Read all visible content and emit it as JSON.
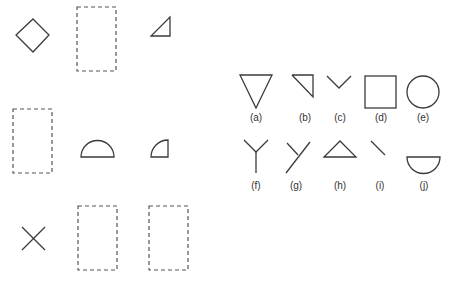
{
  "figure": {
    "left_panel": {
      "description": "Shapes with dashed placeholder rectangles",
      "rows": [
        [
          "diamond",
          "dashed-rectangle",
          "right-triangle"
        ],
        [
          "dashed-rectangle",
          "semicircle",
          "quarter-circle"
        ],
        [
          "x-cross",
          "dashed-rectangle",
          "dashed-rectangle"
        ]
      ]
    },
    "right_panel": {
      "items": [
        {
          "label": "(a)",
          "shape": "inverted-triangle"
        },
        {
          "label": "(b)",
          "shape": "right-angle-wedge"
        },
        {
          "label": "(c)",
          "shape": "v-chevron"
        },
        {
          "label": "(d)",
          "shape": "square"
        },
        {
          "label": "(e)",
          "shape": "circle"
        },
        {
          "label": "(f)",
          "shape": "y-junction"
        },
        {
          "label": "(g)",
          "shape": "slanted-y-junction"
        },
        {
          "label": "(h)",
          "shape": "triangle"
        },
        {
          "label": "(i)",
          "shape": "diagonal-line"
        },
        {
          "label": "(j)",
          "shape": "bowl-semicircle"
        }
      ]
    },
    "colors": {
      "stroke": "#3a3a3a",
      "background": "#ffffff"
    }
  }
}
